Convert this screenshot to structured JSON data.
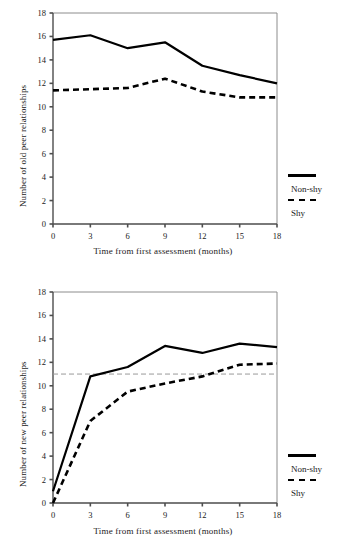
{
  "figure": {
    "panels": [
      {
        "id": "old-peer-relationships",
        "ylabel": "Number of old peer relationships",
        "xlabel": "Time from first assessment (months)",
        "legend": {
          "solid_label": "Non-shy",
          "dashed_label": "Shy"
        }
      },
      {
        "id": "new-peer-relationships",
        "ylabel": "Number of new peer relationships",
        "xlabel": "Time from first assessment (months)",
        "legend": {
          "solid_label": "Non-shy",
          "dashed_label": "Shy"
        }
      }
    ]
  },
  "chart_data": [
    {
      "type": "line",
      "title": "",
      "xlabel": "Time from first assessment (months)",
      "ylabel": "Number of old peer relationships",
      "x": [
        0,
        3,
        6,
        9,
        12,
        15,
        18
      ],
      "xticks": [
        "0",
        "3",
        "6",
        "9",
        "12",
        "15",
        "18"
      ],
      "yticks": [
        "0",
        "2",
        "4",
        "6",
        "8",
        "10",
        "12",
        "14",
        "16",
        "18"
      ],
      "xlim": [
        0,
        18
      ],
      "ylim": [
        0,
        18
      ],
      "grid": false,
      "legend_position": "right",
      "series": [
        {
          "name": "Non-shy",
          "style": "solid",
          "values": [
            15.7,
            16.1,
            15.0,
            15.5,
            13.5,
            12.7,
            12.0
          ]
        },
        {
          "name": "Shy",
          "style": "dashed",
          "values": [
            11.4,
            11.5,
            11.6,
            12.4,
            11.3,
            10.8,
            10.8
          ]
        }
      ]
    },
    {
      "type": "line",
      "title": "",
      "xlabel": "Time from first assessment (months)",
      "ylabel": "Number of new peer relationships",
      "x": [
        0,
        3,
        6,
        9,
        12,
        15,
        18
      ],
      "xticks": [
        "0",
        "3",
        "6",
        "9",
        "12",
        "15",
        "18"
      ],
      "yticks": [
        "0",
        "2",
        "4",
        "6",
        "8",
        "10",
        "12",
        "14",
        "16",
        "18"
      ],
      "xlim": [
        0,
        18
      ],
      "ylim": [
        0,
        18
      ],
      "grid": false,
      "legend_position": "right",
      "reference_line": {
        "y": 11,
        "style": "dashed",
        "color": "#999999"
      },
      "series": [
        {
          "name": "Non-shy",
          "style": "solid",
          "values": [
            1.0,
            10.8,
            11.6,
            13.4,
            12.8,
            13.6,
            13.3
          ]
        },
        {
          "name": "Shy",
          "style": "dashed",
          "values": [
            0.0,
            7.0,
            9.5,
            10.2,
            10.8,
            11.8,
            11.9
          ]
        }
      ]
    }
  ],
  "colors": {
    "line": "#000000",
    "frame": "#8c8c8c",
    "axis": "#4d4d4d",
    "reference": "#999999",
    "text": "#1a1a1a"
  }
}
